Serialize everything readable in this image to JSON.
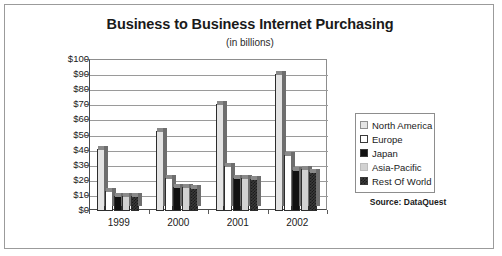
{
  "chart_data": {
    "type": "bar",
    "title": "Business to Business Internet Purchasing",
    "subtitle": "(in billions)",
    "xlabel": "",
    "ylabel": "",
    "ylim": [
      0,
      100
    ],
    "ytick_labels": [
      "$100",
      "$90",
      "$80",
      "$70",
      "$60",
      "$50",
      "$40",
      "$30",
      "$20",
      "$10",
      "$0"
    ],
    "ytick_values": [
      100,
      90,
      80,
      70,
      60,
      50,
      40,
      30,
      20,
      10,
      0
    ],
    "grid": true,
    "legend_position": "right",
    "categories": [
      "1999",
      "2000",
      "2001",
      "2002"
    ],
    "series": [
      {
        "name": "North America",
        "values": [
          41,
          53,
          71,
          91
        ],
        "swatch": "dotted-light-gray"
      },
      {
        "name": "Europe",
        "values": [
          13,
          22,
          30,
          37
        ],
        "swatch": "white"
      },
      {
        "name": "Japan",
        "values": [
          10,
          16,
          22,
          27
        ],
        "swatch": "black"
      },
      {
        "name": "Asia-Pacific",
        "values": [
          10,
          16,
          22,
          28
        ],
        "swatch": "light-gray"
      },
      {
        "name": "Rest Of World",
        "values": [
          10,
          15,
          21,
          26
        ],
        "swatch": "dark-checkered"
      }
    ],
    "source": "Source: DataQuest"
  },
  "colors": {
    "frame_border": "#9b9b9b",
    "axis": "#4a4a4a",
    "gridline": "#9a9a9a",
    "bar_outline": "#2d2d2d",
    "north_america": "#e4e4e4",
    "europe": "#ffffff",
    "japan": "#111111",
    "asia_pacific": "#d2d2d2",
    "rest_of_world": "#3a3a3a",
    "text": "#1a1a1a"
  }
}
